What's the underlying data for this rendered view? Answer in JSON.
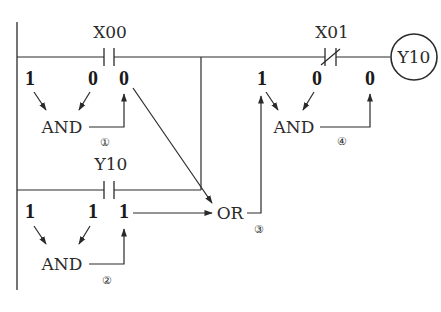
{
  "diagram": {
    "type": "ladder-logic-evaluation",
    "rung1": {
      "contact_1": {
        "label": "X00",
        "kind": "normally-open"
      },
      "contact_2": {
        "label": "X01",
        "kind": "normally-closed"
      },
      "coil": {
        "label": "Y10"
      },
      "left_values": [
        "1",
        "0",
        "0"
      ],
      "right_values": [
        "1",
        "0",
        "0"
      ]
    },
    "rung2": {
      "contact_1": {
        "label": "Y10",
        "kind": "normally-open"
      },
      "values": [
        "1",
        "1",
        "1"
      ]
    },
    "operations": [
      {
        "label": "AND",
        "step": "①"
      },
      {
        "label": "AND",
        "step": "②"
      },
      {
        "label": "OR",
        "step": "③"
      },
      {
        "label": "AND",
        "step": "④"
      }
    ]
  }
}
